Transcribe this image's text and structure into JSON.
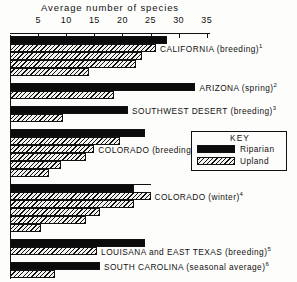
{
  "chart_data": {
    "type": "bar",
    "orientation": "horizontal",
    "title": "",
    "xlabel": "Average number of species",
    "ylabel": "",
    "xlim": [
      0,
      37
    ],
    "xticks": [
      5,
      10,
      15,
      20,
      25,
      30,
      35
    ],
    "xtick_labels": [
      "5",
      "10",
      "15",
      "20",
      "25",
      "30",
      "35"
    ],
    "grid": false,
    "legend": {
      "title": "KEY",
      "position": "middle-right",
      "entries": [
        {
          "name": "Riparian",
          "fill": "solid-black",
          "color": "#0b0b0b"
        },
        {
          "name": "Upland",
          "fill": "diagonal-hatch",
          "color": "#111111"
        }
      ]
    },
    "series": [
      {
        "name": "Riparian",
        "fill": "solid-black"
      },
      {
        "name": "Upland",
        "fill": "diagonal-hatch"
      }
    ],
    "groups": [
      {
        "label": "CALIFORNIA (breeding)",
        "footnote": "1",
        "bars": [
          {
            "series": "Riparian",
            "value": 28
          },
          {
            "series": "Upland",
            "value": 26
          },
          {
            "series": "Upland",
            "value": 23.5
          },
          {
            "series": "Upland",
            "value": 22.5
          },
          {
            "series": "Upland",
            "value": 14
          }
        ]
      },
      {
        "label": "ARIZONA (spring)",
        "footnote": "2",
        "bars": [
          {
            "series": "Riparian",
            "value": 33
          },
          {
            "series": "Upland",
            "value": 18.5
          }
        ]
      },
      {
        "label": "SOUTHWEST DESERT (breeding)",
        "footnote": "3",
        "bars": [
          {
            "series": "Riparian",
            "value": 21
          },
          {
            "series": "Upland",
            "value": 9.5
          }
        ]
      },
      {
        "label": "COLORADO (breeding)",
        "footnote": "4",
        "bars": [
          {
            "series": "Riparian",
            "value": 24
          },
          {
            "series": "Upland",
            "value": 19.5
          },
          {
            "series": "Upland",
            "value": 15
          },
          {
            "series": "Upland",
            "value": 13.5
          },
          {
            "series": "Upland",
            "value": 9
          },
          {
            "series": "Upland",
            "value": 7
          }
        ]
      },
      {
        "label": "COLORADO (winter)",
        "footnote": "4",
        "bars": [
          {
            "series": "Riparian",
            "value": 22
          },
          {
            "series": "Upland",
            "value": 25
          },
          {
            "series": "Upland",
            "value": 22
          },
          {
            "series": "Upland",
            "value": 16
          },
          {
            "series": "Upland",
            "value": 13.5
          },
          {
            "series": "Upland",
            "value": 5.5
          }
        ]
      },
      {
        "label": "LOUISANA and EAST TEXAS (breeding)",
        "footnote": "5",
        "bars": [
          {
            "series": "Riparian",
            "value": 24
          },
          {
            "series": "Upland",
            "value": 15.5
          }
        ]
      },
      {
        "label": "SOUTH CAROLINA (seasonal average)",
        "footnote": "6",
        "bars": [
          {
            "series": "Riparian",
            "value": 16
          },
          {
            "series": "Upland",
            "value": 8
          }
        ]
      }
    ]
  }
}
